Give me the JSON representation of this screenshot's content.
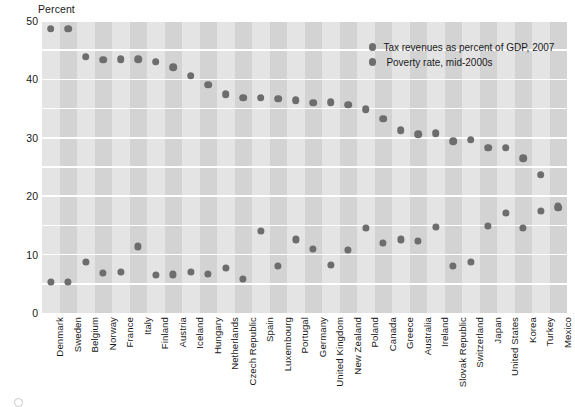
{
  "chart_data": {
    "type": "scatter",
    "title": "",
    "ylabel": "Percent",
    "xlabel": "",
    "ylim": [
      0,
      50
    ],
    "yticks": [
      0,
      10,
      20,
      30,
      40,
      50
    ],
    "gridlines": [
      0,
      5,
      10,
      15,
      20,
      25,
      30,
      35,
      40,
      45,
      50
    ],
    "grid": true,
    "legend_position": "top-right",
    "categories": [
      "Denmark",
      "Sweden",
      "Belgium",
      "Norway",
      "France",
      "Italy",
      "Finland",
      "Austria",
      "Iceland",
      "Hungary",
      "Netherlands",
      "Czech Republic",
      "Spain",
      "Luxembourg",
      "Portugal",
      "Germany",
      "United Kingdom",
      "New Zealand",
      "Poland",
      "Canada",
      "Greece",
      "Australia",
      "Ireland",
      "Slovak Republic",
      "Switzerland",
      "Japan",
      "United States",
      "Korea",
      "Turkey",
      "Mexico"
    ],
    "series": [
      {
        "name": "Tax revenues as percent of GDP, 2007",
        "color": "#6d6d6d",
        "values": [
          48.7,
          48.7,
          43.9,
          43.4,
          43.5,
          43.5,
          43.0,
          42.1,
          40.6,
          39.1,
          37.5,
          36.9,
          36.9,
          36.7,
          36.4,
          36.0,
          36.1,
          35.7,
          34.9,
          33.3,
          31.3,
          30.6,
          30.8,
          29.4,
          29.7,
          28.3,
          28.3,
          26.5,
          23.7,
          18.0
        ]
      },
      {
        "name": "Poverty rate, mid-2000s",
        "color": "#6d6d6d",
        "values": [
          5.3,
          5.3,
          8.8,
          6.8,
          7.1,
          11.4,
          6.5,
          6.6,
          7.1,
          6.7,
          7.7,
          5.8,
          14.1,
          8.1,
          12.6,
          11.0,
          8.3,
          10.8,
          14.6,
          12.0,
          12.6,
          12.4,
          14.8,
          8.1,
          8.7,
          14.9,
          17.1,
          14.6,
          17.5,
          18.4
        ]
      }
    ]
  },
  "legend": {
    "items": [
      {
        "label": "Tax revenues as percent of GDP, 2007"
      },
      {
        "label": "Poverty rate, mid-2000s"
      }
    ]
  }
}
